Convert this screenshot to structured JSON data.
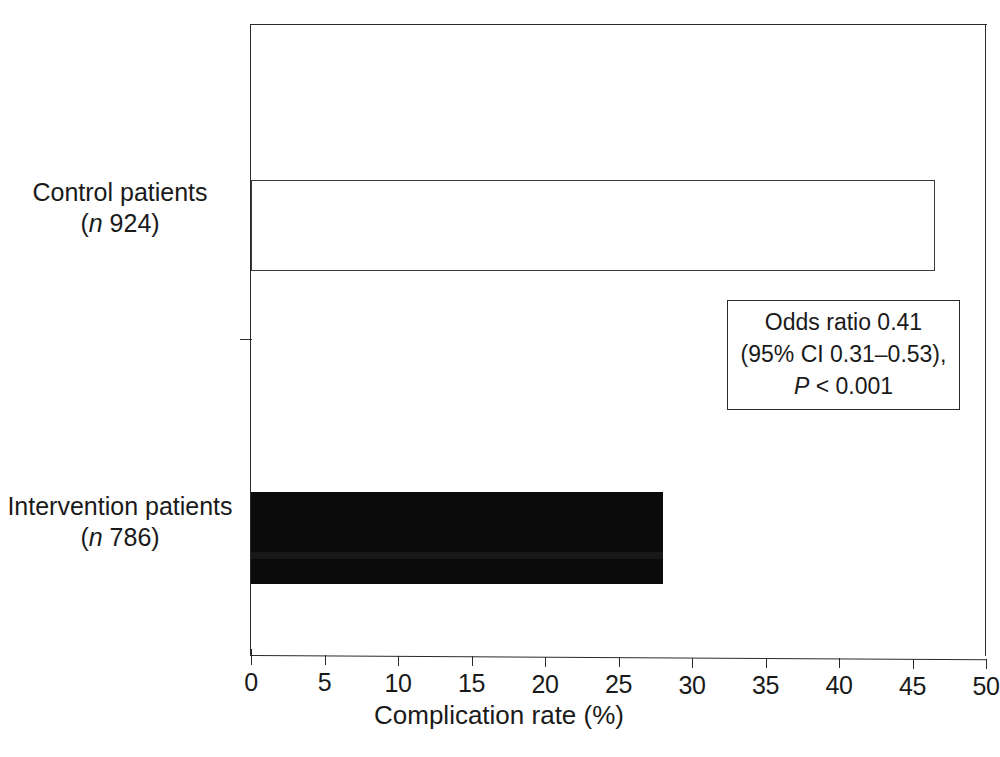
{
  "chart_data": {
    "type": "bar",
    "orientation": "horizontal",
    "title": "",
    "xlabel": "Complication rate (%)",
    "ylabel": "",
    "xlim": [
      0,
      50
    ],
    "xticks": [
      "0",
      "5",
      "10",
      "15",
      "20",
      "25",
      "30",
      "35",
      "40",
      "45",
      "50"
    ],
    "xtick_values": [
      0,
      5,
      10,
      15,
      20,
      25,
      30,
      35,
      40,
      45,
      50
    ],
    "grid": false,
    "legend": "none",
    "categories": [
      "Control patients (n 924)",
      "Intervention patients (n 786)"
    ],
    "values": [
      46.5,
      28.0
    ],
    "bars": [
      {
        "name": "control",
        "label_line1": "Control patients",
        "label_paren_open": "(",
        "label_n": "n",
        "label_count": " 924)",
        "value": 46.5,
        "fill": "white",
        "edge_color": "#3a3a3a"
      },
      {
        "name": "intervention",
        "label_line1": "Intervention patients",
        "label_paren_open": "(",
        "label_n": "n",
        "label_count": " 786)",
        "value": 28.0,
        "fill": "#0b0b0b",
        "edge_color": "#0b0b0b"
      }
    ],
    "annotations": [
      {
        "name": "odds-ratio-box",
        "line1": "Odds ratio 0.41",
        "line2": "(95% CI 0.31–0.53),",
        "line3_italic": "P",
        "line3_rest": " < 0.001"
      }
    ],
    "colors": {
      "background": "#ffffff",
      "ink": "#1a1a1a",
      "bar_fill_dark": "#0b0b0b",
      "bar_fill_light": "#ffffff",
      "axis": "#2a2a2a"
    }
  },
  "caption": {
    "clipped_text": ""
  }
}
